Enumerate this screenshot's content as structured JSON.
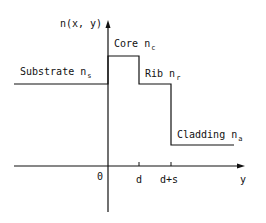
{
  "diagram": {
    "type": "step-index-profile",
    "y_axis_label": "n(x, y)",
    "x_axis_label": "y",
    "ticks": [
      {
        "label": "0"
      },
      {
        "label": "d"
      },
      {
        "label": "d+s"
      }
    ],
    "regions": [
      {
        "name": "Substrate",
        "symbol": "n",
        "subscript": "s"
      },
      {
        "name": "Core",
        "symbol": "n",
        "subscript": "c"
      },
      {
        "name": "Rib",
        "symbol": "n",
        "subscript": "r"
      },
      {
        "name": "Cladding",
        "symbol": "n",
        "subscript": "a"
      }
    ],
    "line_color": "#111111"
  }
}
